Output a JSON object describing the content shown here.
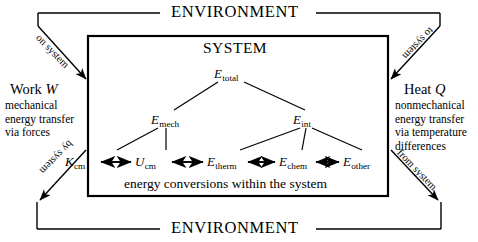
{
  "environment": {
    "top_label": "ENVIRONMENT",
    "bottom_label": "ENVIRONMENT"
  },
  "system": {
    "title": "SYSTEM",
    "conversions_caption": "energy conversions within the system"
  },
  "transfers": {
    "work": {
      "heading_prefix": "Work ",
      "heading_symbol": "W",
      "description": "mechanical\nenergy transfer\nvia forces",
      "inbound_label": "on system",
      "outbound_label": "by system"
    },
    "heat": {
      "heading_prefix": "Heat ",
      "heading_symbol": "Q",
      "description": "nonmechanical\nenergy transfer\nvia temperature\ndifferences",
      "inbound_label": "to system",
      "outbound_label": "from system"
    }
  },
  "energy_tree": {
    "root": {
      "symbol": "E",
      "subscript": "total"
    },
    "branches": [
      {
        "symbol": "E",
        "subscript": "mech"
      },
      {
        "symbol": "E",
        "subscript": "int"
      }
    ],
    "leaves": [
      {
        "symbol": "K",
        "subscript": "cm",
        "parent": "mech"
      },
      {
        "symbol": "U",
        "subscript": "cm",
        "parent": "mech"
      },
      {
        "symbol": "E",
        "subscript": "therm",
        "parent": "int"
      },
      {
        "symbol": "E",
        "subscript": "chem",
        "parent": "int"
      },
      {
        "symbol": "E",
        "subscript": "other",
        "parent": "int"
      }
    ],
    "conversion_arrows": "bidirectional"
  },
  "colors": {
    "ink": "#000000",
    "background": "#ffffff"
  }
}
